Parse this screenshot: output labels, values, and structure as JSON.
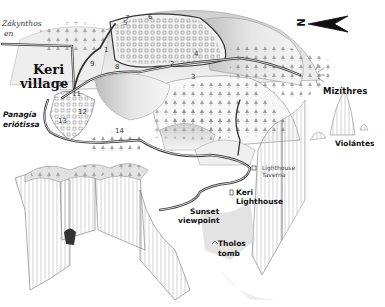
{
  "map": {
    "title": "Keri area hand-drawn map",
    "north_indicator": {
      "letter": "N",
      "direction": "left"
    },
    "labels": {
      "zakynthos": "Zákynthos",
      "zakynthos_sub": "en",
      "keri_village_line1": "Keri",
      "keri_village_line2": "village",
      "panagia_line1": "Panagía",
      "panagia_line2": "eriótissa",
      "mizithres": "Mizíthres",
      "violantes": "Violántes",
      "lighthouse_taverna_line1": "Lighthouse",
      "lighthouse_taverna_line2": "Taverna",
      "keri_lighthouse_line1": "Keri",
      "keri_lighthouse_line2": "Lighthouse",
      "sunset_line1": "Sunset",
      "sunset_line2": "viewpoint",
      "tholos_line1": "Tholos",
      "tholos_line2": "tomb"
    },
    "waypoints": [
      "1",
      "2",
      "3",
      "4",
      "5",
      "6",
      "7",
      "8",
      "9",
      "10",
      "11",
      "12",
      "13",
      "14"
    ],
    "colors": {
      "ink": "#222222",
      "road": "#333333",
      "shade": "#9a9a9a",
      "paper": "#ffffff"
    }
  }
}
